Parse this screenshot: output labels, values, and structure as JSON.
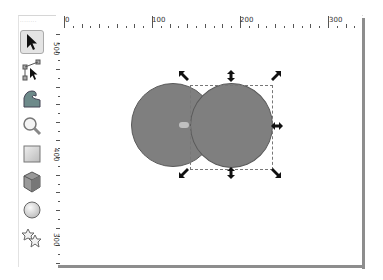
{
  "window": {
    "corner_label": "........"
  },
  "ruler": {
    "horizontal_labels": [
      {
        "text": "0",
        "x": 63
      },
      {
        "text": "100",
        "x": 150
      },
      {
        "text": "200",
        "x": 238
      },
      {
        "text": "300",
        "x": 327
      }
    ],
    "vertical_labels": [
      {
        "text": "500",
        "y": 42
      },
      {
        "text": "400",
        "y": 148
      },
      {
        "text": "300",
        "y": 233
      }
    ]
  },
  "toolbar": {
    "tools": [
      {
        "name": "selector-tool",
        "icon": "arrow-icon",
        "active": true
      },
      {
        "name": "node-tool",
        "icon": "node-edit-icon",
        "active": false
      },
      {
        "name": "tweak-tool",
        "icon": "wave-icon",
        "active": false
      },
      {
        "name": "zoom-tool",
        "icon": "magnifier-icon",
        "active": false
      },
      {
        "name": "rectangle-tool",
        "icon": "square-icon",
        "active": false
      },
      {
        "name": "3d-box-tool",
        "icon": "cube-icon",
        "active": false
      },
      {
        "name": "ellipse-tool",
        "icon": "circle-icon",
        "active": false
      },
      {
        "name": "star-tool",
        "icon": "star-icon",
        "active": false
      }
    ]
  },
  "canvas": {
    "objects": [
      {
        "type": "circle",
        "fill": "#7f7f7f",
        "stroke": "#5a5a5a"
      },
      {
        "type": "circle",
        "fill": "#7f7f7f",
        "stroke": "#5a5a5a"
      }
    ],
    "selection": {
      "handles": "scale-arrows",
      "border": "dashed"
    }
  },
  "colors": {
    "circle_fill": "#7f7f7f",
    "circle_stroke": "#5a5a5a",
    "frame_shadow": "#8d8d8d"
  }
}
